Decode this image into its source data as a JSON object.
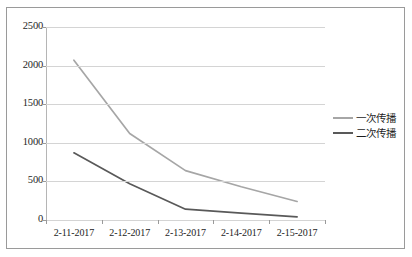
{
  "chart_data": {
    "type": "line",
    "title": "",
    "xlabel": "",
    "ylabel": "",
    "categories": [
      "2-11-2017",
      "2-12-2017",
      "2-13-2017",
      "2-14-2017",
      "2-15-2017"
    ],
    "series": [
      {
        "name": "一次传播",
        "color": "#a6a6a6",
        "values": [
          2070,
          1120,
          640,
          430,
          240
        ]
      },
      {
        "name": "二次传播",
        "color": "#595959",
        "values": [
          870,
          470,
          140,
          90,
          40
        ]
      }
    ],
    "ylim": [
      0,
      2500
    ],
    "ytick_labels": [
      "2500",
      "2000",
      "1500",
      "1000",
      "500",
      "0"
    ],
    "ytick_values": [
      2500,
      2000,
      1500,
      1000,
      500,
      0
    ],
    "grid": true,
    "legend_position": "right"
  },
  "legend": {
    "items": [
      {
        "label": "一次传播",
        "color": "#a6a6a6"
      },
      {
        "label": "二次传播",
        "color": "#595959"
      }
    ]
  },
  "axes": {
    "y_labels": [
      "2500",
      "2000",
      "1500",
      "1000",
      "500",
      "0"
    ],
    "x_labels": [
      "2-11-2017",
      "2-12-2017",
      "2-13-2017",
      "2-14-2017",
      "2-15-2017"
    ]
  }
}
